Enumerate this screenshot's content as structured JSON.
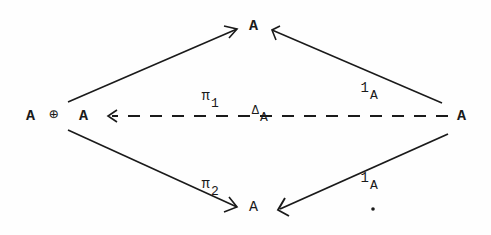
{
  "diagram": {
    "type": "commutative-diagram",
    "nodes": {
      "top": "A",
      "left_a1": "A",
      "left_oplus": "⊕",
      "left_a2": "A",
      "right": "A",
      "bottom": "A"
    },
    "arrows": [
      {
        "from": "A ⊕ A",
        "to": "A (top)",
        "style": "solid",
        "label": "π",
        "label_sub": "1"
      },
      {
        "from": "A ⊕ A",
        "to": "A (bottom)",
        "style": "solid",
        "label": "π",
        "label_sub": "2"
      },
      {
        "from": "A (right)",
        "to": "A (top)",
        "style": "solid",
        "label": "1",
        "label_sub": "A"
      },
      {
        "from": "A (right)",
        "to": "A (bottom)",
        "style": "solid",
        "label": "1",
        "label_sub": "A"
      },
      {
        "from": "A (right)",
        "to": "A ⊕ A",
        "style": "dashed",
        "label": "Δ",
        "label_sub": "A"
      }
    ],
    "labels": {
      "pi1_main": "π",
      "pi1_sub": "1",
      "pi2_main": "π",
      "pi2_sub": "2",
      "id_top_main": "1",
      "id_top_sub": "A",
      "id_bottom_main": "1",
      "id_bottom_sub": "A",
      "delta_main": "Δ",
      "delta_sub": "A"
    },
    "colors": {
      "ink": "#1a1a1a",
      "background": "#fefefe"
    }
  }
}
